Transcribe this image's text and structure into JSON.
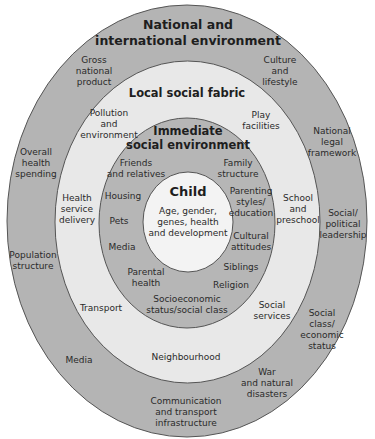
{
  "colors": {
    "outer_ring": "#b4b4b4",
    "local_ring": "#e8e8e8",
    "immediate_ring": "#b6b6b6",
    "child_core": "#f3f3f3",
    "stroke": "#555555"
  },
  "rings": {
    "national": {
      "title": "National and\ninternational environment",
      "items": [
        "Gross\nnational\nproduct",
        "Culture\nand\nlifestyle",
        "National\nlegal\nframework",
        "Overall\nhealth\nspending",
        "Social/\npolitical\nleadership",
        "Population\nstructure",
        "Social class/\neconomic\nstatus",
        "Media",
        "War\nand natural\ndisasters",
        "Communication\nand transport\ninfrastructure"
      ]
    },
    "local": {
      "title": "Local social fabric",
      "items": [
        "Pollution\nand\nenvironment",
        "Play\nfacilities",
        "Health\nservice\ndelivery",
        "School\nand\npreschool",
        "Transport",
        "Social\nservices",
        "Neighbourhood"
      ]
    },
    "immediate": {
      "title": "Immediate\nsocial environment",
      "items": [
        "Friends\nand relatives",
        "Family\nstructure",
        "Housing",
        "Parenting\nstyles/\neducation",
        "Pets",
        "Media",
        "Cultural\nattitudes",
        "Siblings",
        "Parental\nhealth",
        "Religion",
        "Socioeconomic\nstatus/social class"
      ]
    },
    "child": {
      "title": "Child",
      "description": "Age, gender,\ngenes, health\nand development"
    }
  }
}
